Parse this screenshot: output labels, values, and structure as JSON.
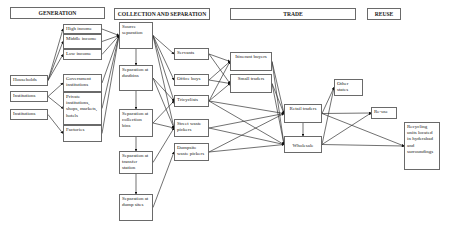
{
  "headers": {
    "generation": "GENERATION",
    "collection": "COLLECTION AND SEPARATION",
    "trade": "TRADE",
    "reuse": "REUSE"
  },
  "sources": {
    "households": "Households",
    "institutions1": "Institutions",
    "institutions2": "Institutions"
  },
  "generators": {
    "high_income": "High income",
    "middle_income": "Middle income",
    "low_income": "Low income",
    "government": "Government institutions",
    "private": "Private institutions, shops, markets, hotels",
    "factories": "Factories"
  },
  "separation": {
    "source": "Source separation",
    "dustbins": "Separation at dustbins",
    "collection_bins": "Separation at collection bins",
    "transfer": "Separation at transfer station",
    "dump": "Separation at dump sites"
  },
  "collectors": {
    "servants": "Servants",
    "office_boys": "Office boys",
    "tricyclists": "Tricyclists",
    "street_pickers": "Street waste pickers",
    "dumpsite_pickers": "Dumpsite waste pickers"
  },
  "traders": {
    "itinerant": "Itinerant buyers",
    "small": "Small traders",
    "retail": "Retail traders",
    "wholesale": "Wholesale"
  },
  "reuse": {
    "other_states": "Other states",
    "reuse": "Re-use",
    "recycling": "Recycling units located in hyderabad and surroundings"
  }
}
